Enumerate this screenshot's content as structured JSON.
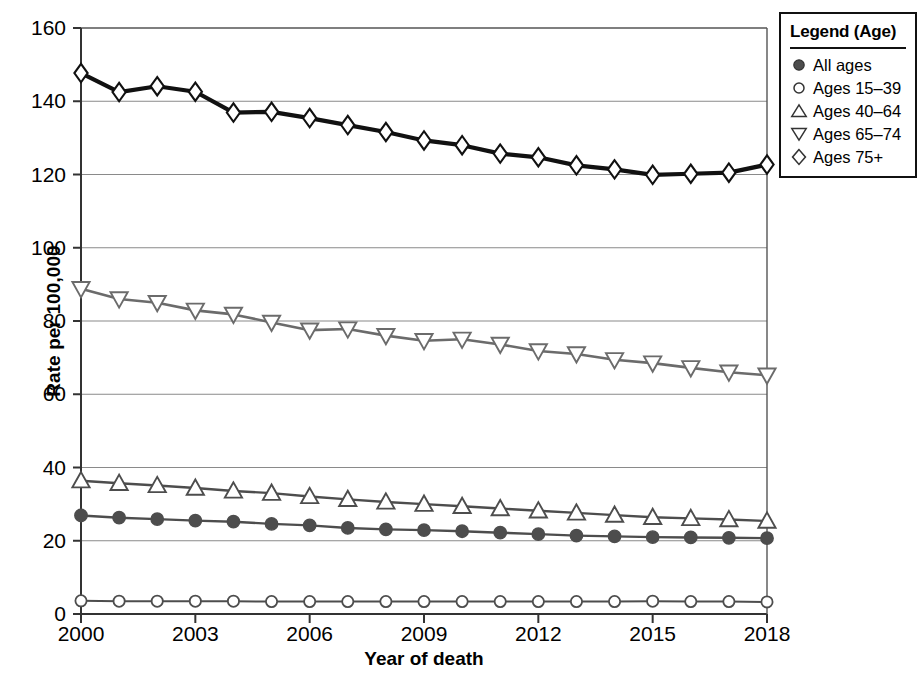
{
  "chart_data": {
    "type": "line",
    "title": "",
    "xlabel": "Year of death",
    "ylabel": "Rate per 100,000",
    "xlim": [
      2000,
      2018
    ],
    "ylim": [
      0,
      160
    ],
    "yticks": [
      0,
      20,
      40,
      60,
      80,
      100,
      120,
      140,
      160
    ],
    "xticks": [
      2000,
      2003,
      2006,
      2009,
      2012,
      2015,
      2018
    ],
    "grid": "horizontal",
    "legend_position": "outside-right-top",
    "x": [
      2000,
      2001,
      2002,
      2003,
      2004,
      2005,
      2006,
      2007,
      2008,
      2009,
      2010,
      2011,
      2012,
      2013,
      2014,
      2015,
      2016,
      2017,
      2018
    ],
    "series": [
      {
        "name": "All ages",
        "marker": "filled-circle",
        "color": "#4d4d4d",
        "values": [
          26.9,
          26.3,
          25.9,
          25.5,
          25.2,
          24.6,
          24.2,
          23.5,
          23.1,
          22.9,
          22.6,
          22.2,
          21.8,
          21.4,
          21.2,
          21.0,
          20.9,
          20.8,
          20.7
        ]
      },
      {
        "name": "Ages 15–39",
        "marker": "open-circle",
        "color": "#4d4d4d",
        "values": [
          3.6,
          3.5,
          3.5,
          3.5,
          3.5,
          3.4,
          3.4,
          3.4,
          3.4,
          3.4,
          3.4,
          3.4,
          3.4,
          3.4,
          3.4,
          3.5,
          3.4,
          3.4,
          3.3
        ]
      },
      {
        "name": "Ages 40–64",
        "marker": "up-triangle",
        "color": "#4d4d4d",
        "values": [
          36.4,
          35.7,
          35.1,
          34.4,
          33.6,
          33.0,
          32.1,
          31.3,
          30.6,
          30.0,
          29.4,
          28.8,
          28.2,
          27.6,
          27.0,
          26.4,
          26.1,
          25.8,
          25.4
        ]
      },
      {
        "name": "Ages 65–74",
        "marker": "down-triangle",
        "color": "#6b6b6b",
        "values": [
          88.8,
          86.0,
          85.0,
          82.9,
          81.8,
          79.6,
          77.5,
          77.8,
          76.0,
          74.6,
          75.0,
          73.6,
          71.8,
          71.0,
          69.4,
          68.5,
          67.2,
          66.0,
          65.2
        ]
      },
      {
        "name": "Ages 75+",
        "marker": "diamond",
        "color": "#111111",
        "values": [
          147.7,
          142.5,
          144.1,
          142.6,
          136.9,
          137.1,
          135.4,
          133.5,
          131.6,
          129.3,
          128.0,
          125.7,
          124.7,
          122.5,
          121.4,
          119.9,
          120.2,
          120.5,
          122.7
        ]
      }
    ]
  },
  "legend": {
    "title": "Legend (Age)",
    "items": [
      {
        "label": "All ages",
        "marker": "filled-circle"
      },
      {
        "label": "Ages 15–39",
        "marker": "open-circle"
      },
      {
        "label": "Ages 40–64",
        "marker": "up-triangle"
      },
      {
        "label": "Ages 65–74",
        "marker": "down-triangle"
      },
      {
        "label": "Ages 75+",
        "marker": "diamond"
      }
    ]
  },
  "axis": {
    "y_title": "Rate per 100,000",
    "x_title": "Year of death",
    "y_tick_labels": [
      "0",
      "20",
      "40",
      "60",
      "80",
      "100",
      "120",
      "140",
      "160"
    ],
    "x_tick_labels": [
      "2000",
      "2003",
      "2006",
      "2009",
      "2012",
      "2015",
      "2018"
    ]
  }
}
